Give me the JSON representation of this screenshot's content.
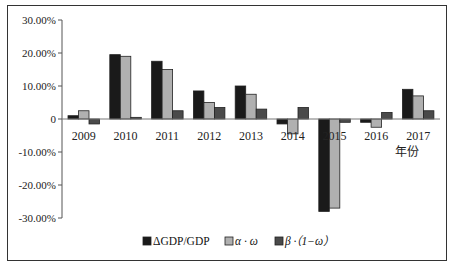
{
  "chart_data": {
    "type": "bar",
    "title": "",
    "xlabel": "年份",
    "ylabel": "",
    "ylim": [
      -30,
      30
    ],
    "yticks": [
      30,
      20,
      10,
      0,
      -10,
      -20,
      -30
    ],
    "ytick_labels": [
      "30.00%",
      "20.00%",
      "10.00%",
      "0",
      "-10.00%",
      "-20.00%",
      "-30.00%"
    ],
    "grid": false,
    "legend_position": "bottom",
    "categories": [
      "2009",
      "2010",
      "2011",
      "2012",
      "2013",
      "2014",
      "2015",
      "2016",
      "2017"
    ],
    "series": [
      {
        "name": "ΔGDP/GDP",
        "color": "#1a1a1a",
        "values": [
          1.0,
          19.5,
          17.5,
          8.5,
          10.0,
          -1.5,
          -28.0,
          -1.0,
          9.0
        ]
      },
      {
        "name": "α · ω",
        "color": "#b0b0b0",
        "values": [
          2.5,
          19.0,
          15.0,
          5.0,
          7.5,
          -4.5,
          -27.0,
          -2.5,
          7.0
        ]
      },
      {
        "name": "β ·（1−ω）",
        "color": "#4a4a4a",
        "values": [
          -1.5,
          0.5,
          2.5,
          3.5,
          3.0,
          3.5,
          -1.0,
          2.0,
          2.5
        ]
      }
    ]
  },
  "legend": {
    "items": [
      "ΔGDP/GDP",
      "α · ω",
      "β ·（1−ω）"
    ]
  }
}
